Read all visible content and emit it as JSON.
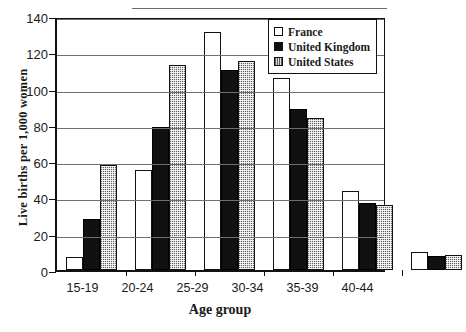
{
  "chart_data": {
    "type": "bar",
    "title": "",
    "xlabel": "Age group",
    "ylabel": "Live births per 1,000 women",
    "categories": [
      "15-19",
      "20-24",
      "25-29",
      "30-34",
      "35-39",
      "40-44"
    ],
    "series": [
      {
        "name": "France",
        "color": "#ffffff",
        "values": [
          7,
          55,
          131,
          106,
          43.5,
          10
        ]
      },
      {
        "name": "United Kingdom",
        "color": "#111111",
        "values": [
          28,
          79,
          110,
          88.5,
          37,
          8
        ]
      },
      {
        "name": "United States",
        "color": "#b4b4b4",
        "values": [
          58,
          113,
          115,
          84,
          36,
          8.5
        ]
      }
    ],
    "ylim": [
      0,
      140
    ],
    "yticks": [
      0,
      20,
      40,
      60,
      80,
      100,
      120,
      140
    ],
    "grid": true,
    "legend_position": "top-right"
  },
  "legend": {
    "items": [
      {
        "label": "France",
        "swatch": "white-square-icon"
      },
      {
        "label": "United Kingdom",
        "swatch": "black-square-icon"
      },
      {
        "label": "United States",
        "swatch": "gray-square-icon"
      }
    ]
  }
}
